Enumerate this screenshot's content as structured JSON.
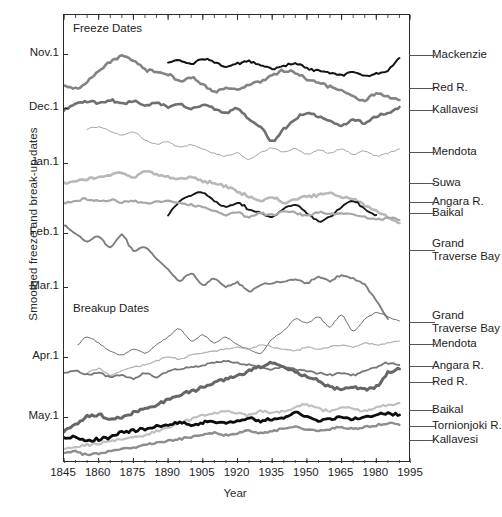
{
  "chart_data": {
    "type": "line",
    "title": "",
    "xlabel": "Year",
    "ylabel": "Smoothed freeze and break-up dates",
    "xlim": [
      1845,
      1995
    ],
    "xticks": [
      1845,
      1860,
      1875,
      1890,
      1905,
      1920,
      1935,
      1950,
      1965,
      1980,
      1995
    ],
    "yticks": [
      "Nov.1",
      "Dec.1",
      "Jan.1",
      "Feb.1",
      "Mar.1",
      "Apr.1",
      "May.1"
    ],
    "ytick_positions_px": [
      54,
      108,
      163,
      233,
      287,
      357,
      417
    ],
    "grid": false,
    "legend": "right-side inline labels with leader lines",
    "annotations": [
      {
        "text": "Freeze Dates",
        "x": 1850,
        "group": "freeze"
      },
      {
        "text": "Breakup Dates",
        "x": 1850,
        "group": "breakup"
      }
    ],
    "series": [
      {
        "name": "Mackenzie",
        "group": "freeze",
        "color": "#121212",
        "width": 2.0,
        "label_y_px": 55,
        "x": [
          1890,
          1895,
          1900,
          1905,
          1910,
          1915,
          1920,
          1925,
          1930,
          1935,
          1940,
          1945,
          1950,
          1955,
          1960,
          1965,
          1970,
          1975,
          1980,
          1985,
          1990
        ],
        "y": [
          62,
          60,
          63,
          58,
          61,
          66,
          63,
          60,
          64,
          68,
          65,
          63,
          67,
          70,
          72,
          74,
          71,
          75,
          73,
          69,
          57
        ]
      },
      {
        "name": "Red R.",
        "group": "freeze",
        "color": "#838383",
        "width": 2.6,
        "label_y_px": 88,
        "x": [
          1845,
          1850,
          1855,
          1860,
          1865,
          1870,
          1875,
          1880,
          1885,
          1890,
          1895,
          1900,
          1905,
          1910,
          1915,
          1920,
          1925,
          1930,
          1935,
          1940,
          1945,
          1950,
          1955,
          1960,
          1965,
          1970,
          1975,
          1980,
          1985,
          1990
        ],
        "y": [
          84,
          88,
          80,
          70,
          61,
          55,
          60,
          68,
          71,
          73,
          80,
          76,
          84,
          90,
          87,
          88,
          84,
          80,
          74,
          70,
          72,
          78,
          82,
          86,
          90,
          95,
          99,
          92,
          96,
          99
        ]
      },
      {
        "name": "Kallavesi",
        "group": "freeze",
        "color": "#6f6f6f",
        "width": 2.6,
        "label_y_px": 110,
        "x": [
          1845,
          1850,
          1855,
          1860,
          1865,
          1870,
          1875,
          1880,
          1885,
          1890,
          1895,
          1900,
          1905,
          1910,
          1915,
          1920,
          1925,
          1930,
          1935,
          1940,
          1945,
          1950,
          1955,
          1960,
          1965,
          1970,
          1975,
          1980,
          1985,
          1990
        ],
        "y": [
          110,
          103,
          100,
          102,
          99,
          103,
          100,
          104,
          101,
          106,
          103,
          107,
          104,
          108,
          112,
          108,
          118,
          126,
          140,
          128,
          118,
          112,
          116,
          120,
          124,
          119,
          122,
          116,
          112,
          106
        ]
      },
      {
        "name": "Mendota",
        "group": "freeze",
        "color": "#9a9a9a",
        "width": 0.9,
        "label_y_px": 152,
        "x": [
          1855,
          1860,
          1865,
          1870,
          1875,
          1880,
          1885,
          1890,
          1895,
          1900,
          1905,
          1910,
          1915,
          1920,
          1925,
          1930,
          1935,
          1940,
          1945,
          1950,
          1955,
          1960,
          1965,
          1970,
          1975,
          1980,
          1985,
          1990
        ],
        "y": [
          128,
          126,
          130,
          134,
          131,
          139,
          143,
          141,
          146,
          144,
          148,
          152,
          155,
          152,
          158,
          152,
          147,
          151,
          148,
          153,
          149,
          152,
          148,
          153,
          150,
          155,
          152,
          148
        ]
      },
      {
        "name": "Suwa",
        "group": "freeze",
        "color": "#b8b8b8",
        "width": 2.6,
        "label_y_px": 183,
        "x": [
          1845,
          1850,
          1855,
          1860,
          1865,
          1870,
          1875,
          1880,
          1885,
          1890,
          1895,
          1900,
          1905,
          1910,
          1915,
          1920,
          1925,
          1930,
          1935,
          1940,
          1945,
          1950,
          1955,
          1960,
          1965,
          1970,
          1975,
          1980,
          1985,
          1990
        ],
        "y": [
          182,
          180,
          178,
          176,
          174,
          172,
          176,
          170,
          174,
          176,
          178,
          176,
          180,
          182,
          186,
          190,
          196,
          200,
          196,
          202,
          198,
          196,
          194,
          192,
          196,
          198,
          204,
          210,
          216,
          222
        ]
      },
      {
        "name": "Angara R.",
        "group": "freeze",
        "color": "#181818",
        "width": 1.9,
        "label_y_px": 202,
        "x": [
          1890,
          1895,
          1900,
          1905,
          1910,
          1915,
          1920,
          1925,
          1930,
          1935,
          1940,
          1945,
          1950,
          1955,
          1960,
          1965,
          1970,
          1975,
          1980
        ],
        "y": [
          214,
          200,
          194,
          192,
          200,
          206,
          202,
          208,
          212,
          216,
          208,
          204,
          212,
          220,
          216,
          206,
          200,
          208,
          214
        ]
      },
      {
        "name": "Baikal",
        "group": "freeze",
        "color": "#a7a7a7",
        "width": 2.2,
        "label_y_px": 213,
        "x": [
          1845,
          1850,
          1855,
          1860,
          1865,
          1870,
          1875,
          1880,
          1885,
          1890,
          1895,
          1900,
          1905,
          1910,
          1915,
          1920,
          1925,
          1930,
          1935,
          1940,
          1945,
          1950,
          1955,
          1960,
          1965,
          1970,
          1975,
          1980,
          1985,
          1990
        ],
        "y": [
          202,
          200,
          198,
          200,
          199,
          201,
          200,
          202,
          201,
          200,
          202,
          204,
          206,
          210,
          214,
          212,
          216,
          212,
          214,
          210,
          212,
          214,
          211,
          213,
          212,
          214,
          216,
          218,
          217,
          219
        ]
      },
      {
        "name": "Grand Traverse Bay",
        "group": "freeze",
        "color": "#7e7e7e",
        "width": 1.9,
        "label_y_px": 250,
        "label_lines": [
          "Grand",
          "Traverse Bay"
        ],
        "x": [
          1845,
          1850,
          1855,
          1860,
          1865,
          1870,
          1875,
          1880,
          1885,
          1890,
          1895,
          1900,
          1905,
          1910,
          1915,
          1920,
          1925,
          1930,
          1935,
          1940,
          1945,
          1950,
          1955,
          1960,
          1965,
          1970,
          1975,
          1980,
          1985
        ],
        "y": [
          224,
          232,
          240,
          236,
          246,
          234,
          250,
          246,
          258,
          268,
          280,
          272,
          284,
          278,
          286,
          282,
          290,
          284,
          282,
          280,
          278,
          282,
          276,
          280,
          274,
          278,
          284,
          300,
          318
        ]
      },
      {
        "name": "Grand Traverse Bay",
        "group": "breakup",
        "color": "#6c6c6c",
        "width": 1.0,
        "label_y_px": 322,
        "label_lines": [
          "Grand",
          "Traverse Bay"
        ],
        "x": [
          1851,
          1855,
          1860,
          1865,
          1870,
          1875,
          1880,
          1885,
          1890,
          1895,
          1900,
          1905,
          1910,
          1915,
          1920,
          1925,
          1930,
          1935,
          1940,
          1945,
          1950,
          1955,
          1960,
          1965,
          1970,
          1975,
          1980,
          1985,
          1990
        ],
        "y": [
          344,
          336,
          342,
          350,
          354,
          348,
          352,
          344,
          336,
          328,
          340,
          334,
          342,
          336,
          344,
          348,
          352,
          338,
          330,
          318,
          322,
          316,
          326,
          314,
          330,
          318,
          312,
          316,
          320
        ]
      },
      {
        "name": "Mendota",
        "group": "breakup",
        "color": "#b0b0b0",
        "width": 1.2,
        "label_y_px": 344,
        "x": [
          1855,
          1860,
          1865,
          1870,
          1875,
          1880,
          1885,
          1890,
          1895,
          1900,
          1905,
          1910,
          1915,
          1920,
          1925,
          1930,
          1935,
          1940,
          1945,
          1950,
          1955,
          1960,
          1965,
          1970,
          1975,
          1980,
          1985,
          1990
        ],
        "y": [
          372,
          368,
          374,
          370,
          366,
          364,
          360,
          356,
          358,
          354,
          352,
          350,
          348,
          346,
          348,
          344,
          346,
          348,
          350,
          346,
          348,
          346,
          344,
          346,
          342,
          344,
          342,
          340
        ]
      },
      {
        "name": "Angara R.",
        "group": "breakup",
        "color": "#777777",
        "width": 1.8,
        "label_y_px": 366,
        "x": [
          1845,
          1850,
          1855,
          1860,
          1865,
          1870,
          1875,
          1880,
          1885,
          1890,
          1895,
          1900,
          1905,
          1910,
          1915,
          1920,
          1925,
          1930,
          1935,
          1940,
          1945,
          1950,
          1955,
          1960,
          1965,
          1970,
          1975,
          1980,
          1985,
          1990
        ],
        "y": [
          372,
          370,
          374,
          372,
          376,
          374,
          378,
          372,
          376,
          370,
          368,
          366,
          364,
          362,
          360,
          362,
          364,
          366,
          368,
          366,
          368,
          370,
          372,
          374,
          372,
          374,
          370,
          366,
          362,
          364
        ]
      },
      {
        "name": "Red R.",
        "group": "breakup",
        "color": "#666666",
        "width": 3.0,
        "label_y_px": 382,
        "x": [
          1845,
          1850,
          1855,
          1860,
          1865,
          1870,
          1875,
          1880,
          1885,
          1890,
          1895,
          1900,
          1905,
          1910,
          1915,
          1920,
          1925,
          1930,
          1935,
          1940,
          1945,
          1950,
          1955,
          1960,
          1965,
          1970,
          1975,
          1980,
          1985,
          1990
        ],
        "y": [
          430,
          424,
          416,
          414,
          418,
          416,
          412,
          408,
          404,
          398,
          394,
          390,
          386,
          382,
          378,
          374,
          370,
          366,
          362,
          366,
          372,
          376,
          380,
          386,
          388,
          386,
          388,
          386,
          372,
          368
        ]
      },
      {
        "name": "Baikal",
        "group": "breakup",
        "color": "#c0c0c0",
        "width": 2.2,
        "label_y_px": 410,
        "x": [
          1845,
          1850,
          1855,
          1860,
          1865,
          1870,
          1875,
          1880,
          1885,
          1890,
          1895,
          1900,
          1905,
          1910,
          1915,
          1920,
          1925,
          1930,
          1935,
          1940,
          1945,
          1950,
          1955,
          1960,
          1965,
          1970,
          1975,
          1980,
          1985,
          1990
        ],
        "y": [
          448,
          446,
          444,
          442,
          440,
          438,
          436,
          434,
          430,
          426,
          422,
          418,
          414,
          412,
          410,
          412,
          414,
          410,
          412,
          410,
          406,
          404,
          408,
          410,
          406,
          408,
          410,
          406,
          404,
          402
        ]
      },
      {
        "name": "Tornionjoki R.",
        "group": "breakup",
        "color": "#0d0d0d",
        "width": 2.8,
        "label_y_px": 426,
        "x": [
          1845,
          1850,
          1855,
          1860,
          1865,
          1870,
          1875,
          1880,
          1885,
          1890,
          1895,
          1900,
          1905,
          1910,
          1915,
          1920,
          1925,
          1930,
          1935,
          1940,
          1945,
          1950,
          1955,
          1960,
          1965,
          1970,
          1975,
          1980,
          1985,
          1990
        ],
        "y": [
          438,
          436,
          440,
          438,
          436,
          432,
          430,
          428,
          426,
          424,
          422,
          424,
          422,
          420,
          422,
          420,
          418,
          420,
          418,
          416,
          412,
          416,
          420,
          418,
          416,
          418,
          416,
          414,
          412,
          414
        ]
      },
      {
        "name": "Kallavesi",
        "group": "breakup",
        "color": "#8d8d8d",
        "width": 2.4,
        "label_y_px": 440,
        "x": [
          1845,
          1850,
          1855,
          1860,
          1865,
          1870,
          1875,
          1880,
          1885,
          1890,
          1895,
          1900,
          1905,
          1910,
          1915,
          1920,
          1925,
          1930,
          1935,
          1940,
          1945,
          1950,
          1955,
          1960,
          1965,
          1970,
          1975,
          1980,
          1985,
          1990
        ],
        "y": [
          452,
          450,
          454,
          452,
          450,
          448,
          446,
          444,
          442,
          440,
          438,
          436,
          434,
          432,
          434,
          432,
          430,
          432,
          430,
          428,
          426,
          428,
          430,
          428,
          426,
          428,
          426,
          424,
          422,
          424
        ]
      }
    ]
  },
  "axes": {
    "y_label": "Smoothed freeze and break-up dates",
    "x_label": "Year"
  },
  "annotations": {
    "freeze": "Freeze Dates",
    "breakup": "Breakup Dates"
  },
  "colors": {
    "frame": "#2b2b2b",
    "text": "#1d1d1d",
    "leader": "#555555",
    "background": "#ffffff"
  }
}
